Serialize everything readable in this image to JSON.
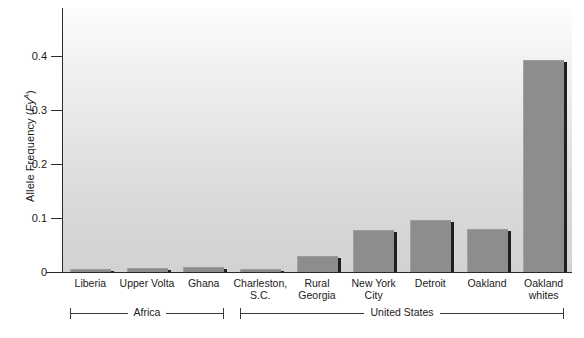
{
  "chart_data": {
    "type": "bar",
    "title": "",
    "xlabel": "",
    "ylabel": "Allele Frequency (Fy^A)",
    "ylabel_parts": {
      "prefix": "Allele Frequency (",
      "italic": "Fy",
      "superscript": "A",
      "suffix": ")"
    },
    "categories": [
      "Liberia",
      "Upper Volta",
      "Ghana",
      "Charleston, S.C.",
      "Rural Georgia",
      "New York City",
      "Detroit",
      "Oakland",
      "Oakland whites"
    ],
    "category_lines": [
      [
        "Liberia"
      ],
      [
        "Upper Volta"
      ],
      [
        "Ghana"
      ],
      [
        "Charleston,",
        "S.C."
      ],
      [
        "Rural",
        "Georgia"
      ],
      [
        "New York",
        "City"
      ],
      [
        "Detroit"
      ],
      [
        "Oakland"
      ],
      [
        "Oakland",
        "whites"
      ]
    ],
    "values": [
      0.006,
      0.008,
      0.01,
      0.005,
      0.03,
      0.078,
      0.097,
      0.079,
      0.393
    ],
    "ylim": [
      0,
      0.49
    ],
    "yticks": [
      0,
      0.1,
      0.2,
      0.3,
      0.4
    ],
    "ytick_labels": [
      "0",
      "0.1",
      "0.2",
      "0.3",
      "0.4"
    ],
    "grid": false,
    "legend": "none",
    "bar_color": "#8d8d8d",
    "groups": [
      {
        "label": "Africa",
        "start_index": 0,
        "end_index": 2
      },
      {
        "label": "United States",
        "start_index": 3,
        "end_index": 8
      }
    ]
  }
}
